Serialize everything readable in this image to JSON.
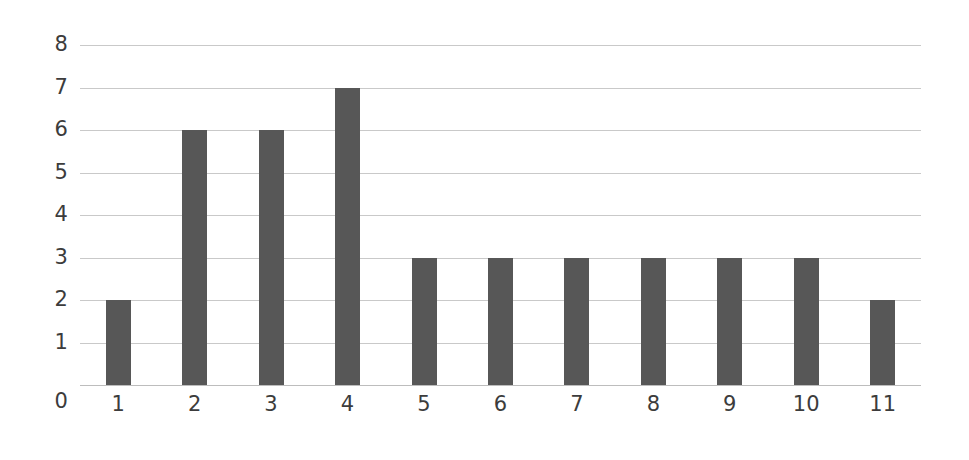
{
  "chart_data": {
    "type": "bar",
    "title": "",
    "subtitle": "",
    "xlabel": "",
    "ylabel": "",
    "categories": [
      "1",
      "2",
      "3",
      "4",
      "5",
      "6",
      "7",
      "8",
      "9",
      "10",
      "11"
    ],
    "values": [
      2,
      6,
      6,
      7,
      3,
      3,
      3,
      3,
      3,
      3,
      2
    ],
    "ylim": [
      0,
      8
    ],
    "y_ticks": [
      "0",
      "1",
      "2",
      "3",
      "4",
      "5",
      "6",
      "7",
      "8"
    ],
    "y_tick_values": [
      0,
      1,
      2,
      3,
      4,
      5,
      6,
      7,
      8
    ],
    "grid": "horizontal",
    "legend": "none",
    "annotations": [],
    "colors": {
      "bar": "#575757",
      "gridline": "#c9c9c9",
      "baseline": "#bdbdbd",
      "tick_label": "#3c3c3c",
      "background": "#ffffff"
    }
  }
}
